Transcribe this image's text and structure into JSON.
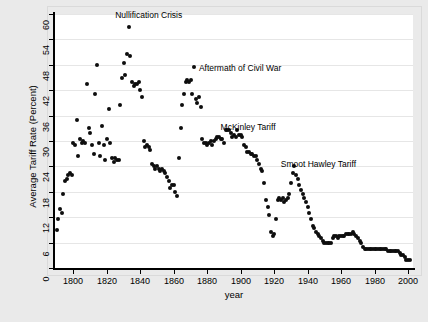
{
  "chart_data": {
    "type": "scatter",
    "title": "",
    "xlabel": "year",
    "ylabel": "Average Tariff Rate (Percent)",
    "xlim": [
      1789,
      2003
    ],
    "ylim": [
      0,
      60
    ],
    "xticks": [
      1800,
      1820,
      1840,
      1860,
      1880,
      1900,
      1920,
      1940,
      1960,
      1980,
      2000
    ],
    "yticks": [
      0,
      6,
      12,
      18,
      24,
      30,
      36,
      42,
      48,
      54,
      60
    ],
    "xtick_labels": [
      "1800",
      "1820",
      "1840",
      "1860",
      "1880",
      "1900",
      "1920",
      "1940",
      "1960",
      "1980",
      "2000"
    ],
    "ytick_labels": [
      "0",
      "6",
      "12",
      "18",
      "24",
      "30",
      "36",
      "42",
      "48",
      "54",
      "60"
    ],
    "grid": "horizontal",
    "legend": "none",
    "marker_color": "#0d0d0d",
    "background_color": "#eaeaea",
    "panel_color": "#ffffff",
    "gridline_color": "#e6e6e6",
    "annotations": [
      {
        "label": "Nullification Crisis",
        "x": 1833,
        "y": 59.0,
        "text_x": 1825,
        "text_y": 60.0
      },
      {
        "label": "Aftermath of Civil War",
        "x": 1872,
        "y": 47.5,
        "text_x": 1875,
        "text_y": 47.6
      },
      {
        "label": "McKinley Tariff",
        "x": 1891,
        "y": 33.5,
        "text_x": 1888,
        "text_y": 33.6
      },
      {
        "label": "Smoot Hawley Tariff",
        "x": 1930,
        "y": 24.5,
        "text_x": 1924,
        "text_y": 24.8
      }
    ],
    "points": [
      [
        1790,
        9.0
      ],
      [
        1791,
        11.5
      ],
      [
        1792,
        14.0
      ],
      [
        1793,
        13.0
      ],
      [
        1794,
        17.5
      ],
      [
        1795,
        20.5
      ],
      [
        1796,
        21.0
      ],
      [
        1797,
        22.0
      ],
      [
        1798,
        22.5
      ],
      [
        1799,
        22.0
      ],
      [
        1800,
        29.5
      ],
      [
        1801,
        29.0
      ],
      [
        1802,
        35.0
      ],
      [
        1803,
        26.5
      ],
      [
        1804,
        30.5
      ],
      [
        1805,
        29.5
      ],
      [
        1806,
        30.0
      ],
      [
        1807,
        29.5
      ],
      [
        1808,
        43.5
      ],
      [
        1809,
        33.0
      ],
      [
        1810,
        32.0
      ],
      [
        1811,
        29.0
      ],
      [
        1812,
        27.0
      ],
      [
        1813,
        41.0
      ],
      [
        1814,
        48.0
      ],
      [
        1815,
        29.5
      ],
      [
        1816,
        26.5
      ],
      [
        1817,
        33.5
      ],
      [
        1818,
        29.0
      ],
      [
        1819,
        25.5
      ],
      [
        1820,
        30.5
      ],
      [
        1821,
        37.5
      ],
      [
        1822,
        29.5
      ],
      [
        1823,
        26.0
      ],
      [
        1824,
        25.0
      ],
      [
        1825,
        26.0
      ],
      [
        1826,
        25.5
      ],
      [
        1827,
        25.5
      ],
      [
        1828,
        38.5
      ],
      [
        1829,
        45.0
      ],
      [
        1830,
        48.5
      ],
      [
        1831,
        45.5
      ],
      [
        1832,
        50.5
      ],
      [
        1833,
        57.0
      ],
      [
        1834,
        50.0
      ],
      [
        1835,
        44.0
      ],
      [
        1836,
        43.0
      ],
      [
        1837,
        43.5
      ],
      [
        1838,
        43.5
      ],
      [
        1839,
        44.0
      ],
      [
        1840,
        42.0
      ],
      [
        1841,
        40.5
      ],
      [
        1842,
        30.0
      ],
      [
        1843,
        28.5
      ],
      [
        1844,
        29.0
      ],
      [
        1845,
        28.5
      ],
      [
        1846,
        28.0
      ],
      [
        1847,
        24.5
      ],
      [
        1848,
        24.0
      ],
      [
        1849,
        23.5
      ],
      [
        1850,
        24.0
      ],
      [
        1851,
        23.5
      ],
      [
        1852,
        23.0
      ],
      [
        1853,
        23.5
      ],
      [
        1854,
        23.0
      ],
      [
        1855,
        22.5
      ],
      [
        1856,
        21.5
      ],
      [
        1857,
        20.5
      ],
      [
        1858,
        19.0
      ],
      [
        1859,
        19.5
      ],
      [
        1860,
        19.5
      ],
      [
        1861,
        18.0
      ],
      [
        1862,
        17.0
      ],
      [
        1863,
        26.0
      ],
      [
        1864,
        33.0
      ],
      [
        1865,
        38.5
      ],
      [
        1866,
        41.0
      ],
      [
        1867,
        44.0
      ],
      [
        1868,
        44.5
      ],
      [
        1869,
        44.0
      ],
      [
        1870,
        44.5
      ],
      [
        1871,
        41.0
      ],
      [
        1872,
        47.5
      ],
      [
        1873,
        40.0
      ],
      [
        1874,
        39.0
      ],
      [
        1875,
        40.5
      ],
      [
        1876,
        38.0
      ],
      [
        1877,
        30.5
      ],
      [
        1878,
        29.5
      ],
      [
        1879,
        29.5
      ],
      [
        1880,
        29.0
      ],
      [
        1881,
        29.5
      ],
      [
        1882,
        30.0
      ],
      [
        1883,
        29.0
      ],
      [
        1884,
        30.0
      ],
      [
        1885,
        30.5
      ],
      [
        1886,
        31.0
      ],
      [
        1887,
        31.0
      ],
      [
        1888,
        30.5
      ],
      [
        1889,
        30.5
      ],
      [
        1890,
        29.5
      ],
      [
        1891,
        32.5
      ],
      [
        1892,
        32.5
      ],
      [
        1893,
        32.5
      ],
      [
        1894,
        32.0
      ],
      [
        1895,
        31.0
      ],
      [
        1896,
        31.5
      ],
      [
        1897,
        31.0
      ],
      [
        1898,
        32.5
      ],
      [
        1899,
        31.5
      ],
      [
        1900,
        31.5
      ],
      [
        1901,
        31.0
      ],
      [
        1902,
        29.0
      ],
      [
        1903,
        28.5
      ],
      [
        1904,
        27.5
      ],
      [
        1905,
        27.5
      ],
      [
        1906,
        27.0
      ],
      [
        1907,
        27.0
      ],
      [
        1908,
        26.5
      ],
      [
        1909,
        26.5
      ],
      [
        1910,
        25.5
      ],
      [
        1911,
        24.5
      ],
      [
        1912,
        23.5
      ],
      [
        1913,
        23.0
      ],
      [
        1914,
        20.0
      ],
      [
        1915,
        16.0
      ],
      [
        1916,
        14.5
      ],
      [
        1917,
        12.5
      ],
      [
        1918,
        8.5
      ],
      [
        1919,
        7.5
      ],
      [
        1920,
        8.0
      ],
      [
        1921,
        11.5
      ],
      [
        1922,
        16.0
      ],
      [
        1923,
        16.5
      ],
      [
        1924,
        16.0
      ],
      [
        1925,
        16.5
      ],
      [
        1926,
        15.5
      ],
      [
        1927,
        16.0
      ],
      [
        1928,
        16.5
      ],
      [
        1929,
        17.5
      ],
      [
        1930,
        20.0
      ],
      [
        1931,
        22.5
      ],
      [
        1932,
        24.0
      ],
      [
        1933,
        22.0
      ],
      [
        1934,
        21.0
      ],
      [
        1935,
        19.5
      ],
      [
        1936,
        18.5
      ],
      [
        1937,
        17.5
      ],
      [
        1938,
        16.5
      ],
      [
        1939,
        15.5
      ],
      [
        1940,
        14.5
      ],
      [
        1941,
        13.0
      ],
      [
        1942,
        11.5
      ],
      [
        1943,
        10.0
      ],
      [
        1944,
        9.5
      ],
      [
        1945,
        8.5
      ],
      [
        1946,
        8.0
      ],
      [
        1947,
        7.5
      ],
      [
        1948,
        7.0
      ],
      [
        1949,
        6.5
      ],
      [
        1950,
        6.0
      ],
      [
        1951,
        6.0
      ],
      [
        1952,
        6.0
      ],
      [
        1953,
        6.0
      ],
      [
        1954,
        6.0
      ],
      [
        1955,
        7.0
      ],
      [
        1956,
        7.5
      ],
      [
        1957,
        7.5
      ],
      [
        1958,
        7.0
      ],
      [
        1959,
        7.5
      ],
      [
        1960,
        7.5
      ],
      [
        1961,
        7.5
      ],
      [
        1962,
        7.5
      ],
      [
        1963,
        8.0
      ],
      [
        1964,
        8.0
      ],
      [
        1965,
        8.0
      ],
      [
        1966,
        8.0
      ],
      [
        1967,
        8.5
      ],
      [
        1968,
        8.0
      ],
      [
        1969,
        7.5
      ],
      [
        1970,
        7.0
      ],
      [
        1971,
        6.5
      ],
      [
        1972,
        6.0
      ],
      [
        1973,
        5.0
      ],
      [
        1974,
        4.5
      ],
      [
        1975,
        4.5
      ],
      [
        1976,
        4.5
      ],
      [
        1977,
        4.5
      ],
      [
        1978,
        4.5
      ],
      [
        1979,
        4.5
      ],
      [
        1980,
        4.5
      ],
      [
        1981,
        4.5
      ],
      [
        1982,
        4.5
      ],
      [
        1983,
        4.5
      ],
      [
        1984,
        4.5
      ],
      [
        1985,
        4.5
      ],
      [
        1986,
        4.5
      ],
      [
        1987,
        4.5
      ],
      [
        1988,
        4.0
      ],
      [
        1989,
        4.0
      ],
      [
        1990,
        4.0
      ],
      [
        1991,
        4.0
      ],
      [
        1992,
        4.0
      ],
      [
        1993,
        4.0
      ],
      [
        1994,
        4.0
      ],
      [
        1995,
        3.5
      ],
      [
        1996,
        3.0
      ],
      [
        1997,
        3.0
      ],
      [
        1998,
        2.5
      ],
      [
        1999,
        2.0
      ],
      [
        2000,
        2.0
      ],
      [
        2001,
        2.0
      ]
    ]
  }
}
